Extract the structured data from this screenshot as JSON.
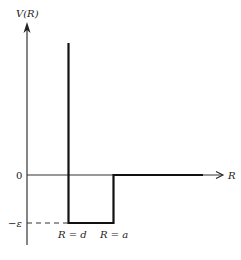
{
  "diagram": {
    "y_axis_label": "V(R)",
    "x_axis_label": "R",
    "zero_label": "0",
    "epsilon_label": "−ε",
    "d_label": "R = d",
    "a_label": "R = a",
    "colors": {
      "line": "#222222",
      "background": "#ffffff"
    }
  }
}
